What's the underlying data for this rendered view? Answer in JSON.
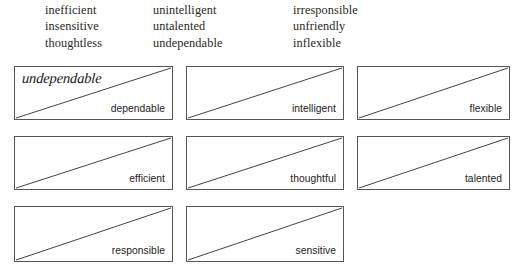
{
  "page": {
    "background_color": "#ffffff",
    "width": 524,
    "height": 277
  },
  "word_bank": {
    "name": "negative-adjectives-word-bank",
    "columns": [
      {
        "name": "word-bank-column-1",
        "words": [
          "inefficient",
          "insensitive",
          "thoughtless"
        ]
      },
      {
        "name": "word-bank-column-2",
        "words": [
          "unintelligent",
          "untalented",
          "undependable"
        ]
      },
      {
        "name": "word-bank-column-3",
        "words": [
          "irresponsible",
          "unfriendly",
          "inflexible"
        ]
      }
    ]
  },
  "exercise": {
    "name": "opposite-pairs-boxes",
    "box_border_color": "#585450",
    "diagonal_color": "#46413d",
    "rows": [
      {
        "name": "box-row-1",
        "boxes": [
          {
            "id": "box-1",
            "prompt": "dependable",
            "answer": "undependable",
            "answer_filled": true
          },
          {
            "id": "box-2",
            "prompt": "intelligent",
            "answer": "",
            "answer_filled": false
          },
          {
            "id": "box-3",
            "prompt": "flexible",
            "answer": "",
            "answer_filled": false
          }
        ]
      },
      {
        "name": "box-row-2",
        "boxes": [
          {
            "id": "box-4",
            "prompt": "efficient",
            "answer": "",
            "answer_filled": false
          },
          {
            "id": "box-5",
            "prompt": "thoughtful",
            "answer": "",
            "answer_filled": false
          },
          {
            "id": "box-6",
            "prompt": "talented",
            "answer": "",
            "answer_filled": false
          }
        ]
      },
      {
        "name": "box-row-3",
        "boxes": [
          {
            "id": "box-7",
            "prompt": "responsible",
            "answer": "",
            "answer_filled": false
          },
          {
            "id": "box-8",
            "prompt": "sensitive",
            "answer": "",
            "answer_filled": false
          }
        ]
      }
    ]
  }
}
